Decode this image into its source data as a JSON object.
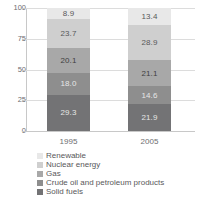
{
  "chart_data": {
    "type": "bar",
    "stacked": true,
    "title": "",
    "subtitle": "",
    "xlabel": "",
    "ylabel": "",
    "categories": [
      "1995",
      "2005"
    ],
    "ylim": [
      0,
      100
    ],
    "yticks": [
      0,
      25,
      50,
      75,
      100
    ],
    "ytick_labels": [
      "0",
      "25",
      "50",
      "75",
      "100"
    ],
    "grid": true,
    "grid_axis": "y",
    "legend_position": "bottom-left",
    "stack_order_bottom_to_top": [
      "Solid fuels",
      "Crude oil and petroleum products",
      "Gas",
      "Nuclear energy",
      "Renewable"
    ],
    "series": [
      {
        "name": "Renewable",
        "color": "#e8e8e8",
        "label_color": "#58585a",
        "values": [
          8.9,
          13.4
        ],
        "value_labels": [
          "8.9",
          "13.4"
        ]
      },
      {
        "name": "Nuclear energy",
        "color": "#cfcfcf",
        "label_color": "#58585a",
        "values": [
          23.7,
          28.9
        ],
        "value_labels": [
          "23.7",
          "28.9"
        ]
      },
      {
        "name": "Gas",
        "color": "#a8a8a8",
        "label_color": "#3f3f41",
        "values": [
          20.1,
          21.1
        ],
        "value_labels": [
          "20.1",
          "21.1"
        ]
      },
      {
        "name": "Crude oil and petroleum products",
        "color": "#8e8e8e",
        "label_color": "#e6e6e6",
        "values": [
          18.0,
          14.6
        ],
        "value_labels": [
          "18.0",
          "14.6"
        ]
      },
      {
        "name": "Solid fuels",
        "color": "#737375",
        "label_color": "#e6e6e6",
        "values": [
          29.3,
          21.9
        ],
        "value_labels": [
          "29.3",
          "21.9"
        ]
      }
    ],
    "legend_entries": [
      {
        "label": "Renewable",
        "color": "#e8e8e8"
      },
      {
        "label": "Nuclear energy",
        "color": "#cfcfcf"
      },
      {
        "label": "Gas",
        "color": "#a8a8a8"
      },
      {
        "label": "Crude oil and petroleum products",
        "color": "#8e8e8e"
      },
      {
        "label": "Solid fuels",
        "color": "#737375"
      }
    ]
  },
  "colors": {
    "grid": "#dcdcdc",
    "axis": "#c8c8c8",
    "text": "#58585a",
    "background": "#ffffff"
  }
}
